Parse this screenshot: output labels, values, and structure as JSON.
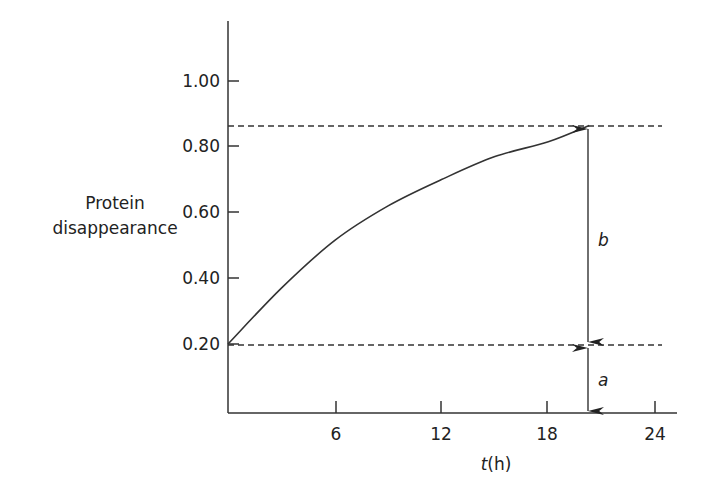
{
  "chart_data": {
    "type": "line",
    "title": "",
    "xlabel_var": "t",
    "xlabel_unit": "(h)",
    "ylabel_lines": [
      "Protein",
      "disappearance"
    ],
    "x_ticks": [
      "6",
      "12",
      "18",
      "24"
    ],
    "y_ticks": [
      "1.00",
      "0.80",
      "0.60",
      "0.40",
      "0.20"
    ],
    "xlim": [
      0,
      25.5
    ],
    "ylim": [
      0,
      1.2
    ],
    "series": [
      {
        "name": "protein disappearance curve",
        "x": [
          0,
          3,
          6,
          9,
          12,
          15,
          18,
          20.3
        ],
        "y": [
          0.2,
          0.37,
          0.515,
          0.62,
          0.7,
          0.77,
          0.815,
          0.865
        ]
      }
    ],
    "reference_lines": [
      {
        "y": 0.865,
        "style": "dashed"
      },
      {
        "y": 0.2,
        "style": "dashed"
      }
    ],
    "annotations": [
      {
        "label": "b",
        "from_y": 0.2,
        "to_y": 0.865,
        "x": 20.3,
        "style": "double-arrow"
      },
      {
        "label": "a",
        "from_y": 0.0,
        "to_y": 0.2,
        "x": 20.3,
        "style": "double-arrow"
      }
    ],
    "grid": false
  }
}
